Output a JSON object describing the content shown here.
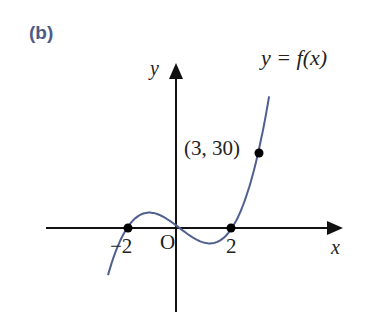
{
  "panel": {
    "label": "(b)"
  },
  "axes": {
    "x_label": "x",
    "y_label": "y",
    "origin_label": "O"
  },
  "ticks": {
    "neg_two": "−2",
    "pos_two": "2"
  },
  "annotations": {
    "point_label": "(3, 30)",
    "function_label": "y = f(x)"
  },
  "colors": {
    "curve": "#4f5f8f",
    "axes": "#111111",
    "panel_label": "#4d5b86"
  },
  "chart_data": {
    "type": "line",
    "title": "",
    "panel": "(b)",
    "xlabel": "x",
    "ylabel": "y",
    "curve_label": "y = f(x)",
    "roots": [
      -2,
      0,
      2
    ],
    "marked_points": [
      {
        "x": -2,
        "y": 0,
        "label": "-2"
      },
      {
        "x": 2,
        "y": 0,
        "label": "2"
      },
      {
        "x": 3,
        "y": 30,
        "label": "(3, 30)"
      }
    ],
    "x_range": [
      -3,
      3.6
    ],
    "sample_x": [
      -2.75,
      -2.5,
      -2.25,
      -2,
      -1.75,
      -1.5,
      -1.25,
      -1.155,
      -1,
      -0.75,
      -0.5,
      -0.25,
      0,
      0.25,
      0.5,
      0.75,
      1,
      1.155,
      1.25,
      1.5,
      1.75,
      2,
      2.25,
      2.5,
      2.75,
      3,
      3.25,
      3.45
    ],
    "grid": false,
    "legend": "none"
  }
}
